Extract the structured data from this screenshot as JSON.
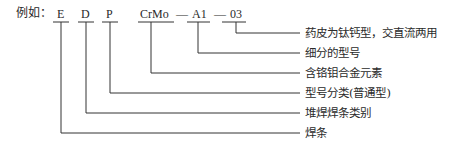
{
  "prefix": "例如：",
  "codes": [
    {
      "text": "E"
    },
    {
      "text": "D"
    },
    {
      "text": "P"
    },
    {
      "text": "CrMo"
    },
    {
      "text": "—"
    },
    {
      "text": "A1"
    },
    {
      "text": "—"
    },
    {
      "text": "03"
    }
  ],
  "labels": [
    "药皮为钛钙型，交直流两用",
    "细分的型号",
    "含铬钼合金元素",
    "型号分类(普通型)",
    "堆焊焊条类别",
    "焊条"
  ]
}
